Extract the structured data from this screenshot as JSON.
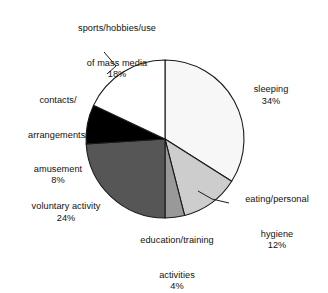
{
  "chart_data": {
    "type": "pie",
    "title": "",
    "subtitle": "",
    "xlabel": "",
    "ylabel": "",
    "legend_position": "none",
    "grid": false,
    "units": "percent",
    "start_angle_deg": 0,
    "direction": "clockwise",
    "categories": [
      "sleeping",
      "eating/personal hygiene",
      "education/training activities",
      "voluntary activity",
      "contacts/arrangements/amusement",
      "sports/hobbies/use of mass media"
    ],
    "values": [
      34,
      12,
      4,
      24,
      8,
      18
    ],
    "slices": [
      {
        "key": "sleeping",
        "label_line1": "sleeping",
        "label_line2": "",
        "label_line3": "",
        "percent_text": "34%",
        "value": 34,
        "color": "#f7f7f7",
        "stroke": "#1a1a1a",
        "leader": false
      },
      {
        "key": "eating-personal-hygiene",
        "label_line1": "eating/personal",
        "label_line2": "hygiene",
        "label_line3": "",
        "percent_text": "12%",
        "value": 12,
        "color": "#cdcdcd",
        "stroke": "#1a1a1a",
        "leader": true
      },
      {
        "key": "education-training-activities",
        "label_line1": "education/training",
        "label_line2": "activities",
        "label_line3": "",
        "percent_text": "4%",
        "value": 4,
        "color": "#999999",
        "stroke": "#1a1a1a",
        "leader": false
      },
      {
        "key": "voluntary-activity",
        "label_line1": "voluntary activity",
        "label_line2": "",
        "label_line3": "",
        "percent_text": "24%",
        "value": 24,
        "color": "#565656",
        "stroke": "#1a1a1a",
        "leader": false
      },
      {
        "key": "contacts-arrangements-amusement",
        "label_line1": "contacts/",
        "label_line2": "arrangements/",
        "label_line3": "amusement",
        "percent_text": "8%",
        "value": 8,
        "color": "#000000",
        "stroke": "#1a1a1a",
        "leader": false
      },
      {
        "key": "sports-hobbies-mass-media",
        "label_line1": "sports/hobbies/use",
        "label_line2": "of mass media",
        "label_line3": "",
        "percent_text": "18%",
        "value": 18,
        "color": "#ffffff",
        "stroke": "#1a1a1a",
        "leader": true
      }
    ]
  }
}
